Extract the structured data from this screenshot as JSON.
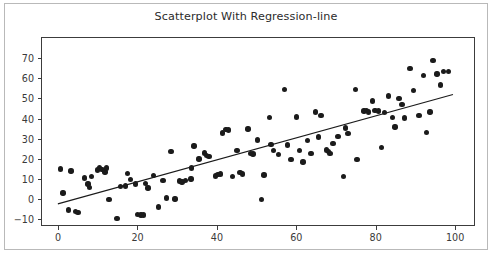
{
  "chart_data": {
    "type": "scatter",
    "title": "Scatterplot With Regression-line",
    "xlabel": "",
    "ylabel": "",
    "xlim": [
      -4.3,
      105.0
    ],
    "ylim": [
      -13.4,
      80.5
    ],
    "xticks": [
      0,
      20,
      40,
      60,
      80,
      100
    ],
    "yticks": [
      -10,
      0,
      10,
      20,
      30,
      40,
      50,
      60,
      70
    ],
    "xtick_labels": [
      "0",
      "20",
      "40",
      "60",
      "80",
      "100"
    ],
    "ytick_labels": [
      "−10",
      "0",
      "10",
      "20",
      "30",
      "40",
      "50",
      "60",
      "70"
    ],
    "grid": false,
    "legend": null,
    "marker_color": "#1b1b1b",
    "line_color": "#1b1b1b",
    "axes_color": "#3c3c3c",
    "background_color": "#ffffff",
    "points": [
      [
        0.3,
        15.4
      ],
      [
        1.0,
        3.4
      ],
      [
        2.3,
        -5.0
      ],
      [
        3.0,
        14.4
      ],
      [
        4.2,
        -5.6
      ],
      [
        4.8,
        -6.3
      ],
      [
        6.4,
        11.0
      ],
      [
        7.3,
        8.0
      ],
      [
        7.6,
        6.1
      ],
      [
        8.2,
        11.8
      ],
      [
        9.6,
        14.9
      ],
      [
        10.2,
        15.9
      ],
      [
        10.8,
        15.1
      ],
      [
        11.6,
        13.9
      ],
      [
        12.0,
        16.0
      ],
      [
        12.6,
        0.4
      ],
      [
        14.6,
        -9.3
      ],
      [
        15.4,
        6.6
      ],
      [
        16.8,
        7.0
      ],
      [
        17.2,
        13.3
      ],
      [
        18.0,
        10.1
      ],
      [
        19.2,
        8.0
      ],
      [
        19.8,
        -7.2
      ],
      [
        20.6,
        -7.4
      ],
      [
        21.2,
        -7.5
      ],
      [
        21.8,
        8.3
      ],
      [
        22.4,
        6.0
      ],
      [
        23.8,
        12.1
      ],
      [
        25.0,
        -3.5
      ],
      [
        26.2,
        9.7
      ],
      [
        27.0,
        1.1
      ],
      [
        28.2,
        24.0
      ],
      [
        29.2,
        0.6
      ],
      [
        30.4,
        9.5
      ],
      [
        31.0,
        8.9
      ],
      [
        31.8,
        9.8
      ],
      [
        33.2,
        10.5
      ],
      [
        33.4,
        16.0
      ],
      [
        34.0,
        26.8
      ],
      [
        35.2,
        20.4
      ],
      [
        36.6,
        23.3
      ],
      [
        37.2,
        22.0
      ],
      [
        37.8,
        21.6
      ],
      [
        39.4,
        12.0
      ],
      [
        40.0,
        12.8
      ],
      [
        40.6,
        13.0
      ],
      [
        41.2,
        33.3
      ],
      [
        42.0,
        35.1
      ],
      [
        42.6,
        34.8
      ],
      [
        43.6,
        11.6
      ],
      [
        44.8,
        24.7
      ],
      [
        45.6,
        13.6
      ],
      [
        46.2,
        13.0
      ],
      [
        47.6,
        35.3
      ],
      [
        48.2,
        23.2
      ],
      [
        48.8,
        22.8
      ],
      [
        50.0,
        29.8
      ],
      [
        51.0,
        0.4
      ],
      [
        51.6,
        12.5
      ],
      [
        53.0,
        41.0
      ],
      [
        53.4,
        27.7
      ],
      [
        54.0,
        24.5
      ],
      [
        55.2,
        22.5
      ],
      [
        56.8,
        55.0
      ],
      [
        57.6,
        27.3
      ],
      [
        58.4,
        20.2
      ],
      [
        59.8,
        41.2
      ],
      [
        60.6,
        24.7
      ],
      [
        61.4,
        18.9
      ],
      [
        62.6,
        29.7
      ],
      [
        63.4,
        23.0
      ],
      [
        64.6,
        43.8
      ],
      [
        65.4,
        31.4
      ],
      [
        66.0,
        42.1
      ],
      [
        67.4,
        24.8
      ],
      [
        67.8,
        24.0
      ],
      [
        68.2,
        23.0
      ],
      [
        69.0,
        28.2
      ],
      [
        70.2,
        31.6
      ],
      [
        71.6,
        11.8
      ],
      [
        72.2,
        35.8
      ],
      [
        72.8,
        33.0
      ],
      [
        74.6,
        55.0
      ],
      [
        75.0,
        20.0
      ],
      [
        76.8,
        44.2
      ],
      [
        77.4,
        44.6
      ],
      [
        78.0,
        43.8
      ],
      [
        79.0,
        49.2
      ],
      [
        79.6,
        44.5
      ],
      [
        80.4,
        44.3
      ],
      [
        81.2,
        26.1
      ],
      [
        82.0,
        43.4
      ],
      [
        83.0,
        51.6
      ],
      [
        84.0,
        41.0
      ],
      [
        84.6,
        36.3
      ],
      [
        85.6,
        50.3
      ],
      [
        86.4,
        47.4
      ],
      [
        87.0,
        40.7
      ],
      [
        88.4,
        65.2
      ],
      [
        89.2,
        54.4
      ],
      [
        90.6,
        42.0
      ],
      [
        91.8,
        61.8
      ],
      [
        92.6,
        33.7
      ],
      [
        93.4,
        43.7
      ],
      [
        94.2,
        69.4
      ],
      [
        95.2,
        62.6
      ],
      [
        96.0,
        57.2
      ],
      [
        96.8,
        63.8
      ],
      [
        98.0,
        63.9
      ]
    ],
    "regression_line": {
      "x0": -0.3,
      "y0": -1.9,
      "x1": 99.2,
      "y1": 52.4,
      "slope": 0.546,
      "intercept": -1.74
    }
  }
}
